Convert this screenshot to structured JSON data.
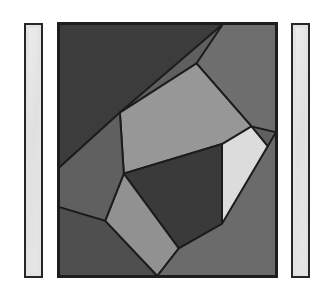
{
  "canvas": {
    "width": 332,
    "height": 297,
    "background_color": "#ffffff",
    "title": "Abstract Geometric Panel"
  },
  "left_bar": {
    "label": "left vertical bar",
    "fill_color": "#e2e2e2",
    "border_color": "#262626",
    "x": 24,
    "y": 23,
    "width": 19,
    "height": 255
  },
  "right_bar": {
    "label": "right vertical bar",
    "fill_color": "#e2e2e2",
    "border_color": "#262626",
    "x": 291,
    "y": 23,
    "width": 19,
    "height": 255
  },
  "mosaic": {
    "label": "abstract geometric tessellation",
    "x": 57,
    "y": 22,
    "width": 221,
    "height": 256,
    "border_color": "#1e1e1e",
    "stroke_color": "#1c1c1c",
    "stroke_width": 2,
    "view_box": "0 0 221 256",
    "regions": [
      {
        "name": "top-left-dark-triangle",
        "fill": "#3c3c3c",
        "points": "0,0 167,0 62,90 0,146"
      },
      {
        "name": "top-right-medium-wedge",
        "fill": "#6e6e6e",
        "points": "167,0 221,0 221,110 196,104 140,40"
      },
      {
        "name": "upper-center-light-polygon",
        "fill": "#979797",
        "points": "140,40 196,104 196,120 166,122 66,152 62,90"
      },
      {
        "name": "right-pointing-pale-triangle",
        "fill": "#dcdcdc",
        "points": "196,104 215,127 196,200 166,203 166,122"
      },
      {
        "name": "center-dark-quadrilateral",
        "fill": "#3a3a3a",
        "points": "166,122 166,203 122,228 66,152"
      },
      {
        "name": "lower-left-light-quadrilateral",
        "fill": "#919191",
        "points": "66,152 122,228 100,256 47,200"
      },
      {
        "name": "left-edge-medium-strip",
        "fill": "#606060",
        "points": "0,146 62,90 66,152 47,200 0,186"
      },
      {
        "name": "bottom-left-dark-wedge",
        "fill": "#4f4f4f",
        "points": "0,186 47,200 100,256 0,256"
      },
      {
        "name": "bottom-right-medium-field",
        "fill": "#6b6b6b",
        "points": "100,256 122,228 166,203 221,110 221,256"
      }
    ],
    "palette": {
      "darkest": "#3a3a3a",
      "dark": "#3c3c3c",
      "mid_dark": "#4f4f4f",
      "mid": "#606060",
      "medium": "#6b6b6b",
      "medium_light": "#6e6e6e",
      "light": "#919191",
      "lighter": "#979797",
      "palest": "#dcdcdc"
    }
  }
}
